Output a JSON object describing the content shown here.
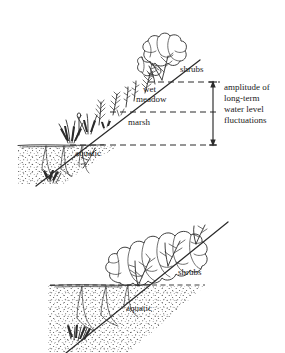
{
  "figure": {
    "background_color": "#ffffff",
    "ink_color": "#2b2b2b",
    "width": 285,
    "height": 353
  },
  "panels": [
    {
      "id": "upper-panel",
      "name": "fluctuating-water-level-shoreline",
      "zones": [
        {
          "key": "shrubs",
          "label": "shrubs",
          "x": 180,
          "y": 72
        },
        {
          "key": "wet_meadow",
          "label_lines": [
            "wet",
            "meadow"
          ],
          "line1": "wet",
          "line2": "meadow",
          "x": 143,
          "y": 92
        },
        {
          "key": "marsh",
          "label": "marsh",
          "x": 128,
          "y": 125
        },
        {
          "key": "aquatic",
          "label": "aquatic",
          "x": 75,
          "y": 152
        }
      ],
      "water_lines": [
        {
          "key": "high_water",
          "y": 82,
          "x1": 148,
          "x2": 220
        },
        {
          "key": "mid_water",
          "y": 112,
          "x1": 110,
          "x2": 220
        },
        {
          "key": "low_water",
          "y": 145,
          "x1": 70,
          "x2": 220
        }
      ],
      "annotation": {
        "key": "amplitude",
        "lines": [
          "amplitude of",
          "long-term",
          "water level",
          "fluctuations"
        ],
        "line1": "amplitude of",
        "line2": "long-term",
        "line3": "water level",
        "line4": "fluctuations",
        "arrow": {
          "x": 213,
          "y_top": 82,
          "y_bottom": 145,
          "double_headed": true
        }
      }
    },
    {
      "id": "lower-panel",
      "name": "stable-water-level-shoreline",
      "zones": [
        {
          "key": "shrubs",
          "label": "shrubs",
          "x": 178,
          "y": 272
        },
        {
          "key": "aquatic",
          "label": "aquatic",
          "x": 126,
          "y": 308
        }
      ],
      "water_lines": [
        {
          "key": "stable_water",
          "y": 285,
          "x1": 50,
          "x2": 205
        }
      ]
    }
  ],
  "icons": {
    "shrub": "shrub-icon",
    "sedge": "sedge-grass-icon",
    "submerged_plant": "submerged-plant-icon",
    "sediment": "sediment-stipple-icon",
    "arrow": "double-arrow-icon"
  }
}
